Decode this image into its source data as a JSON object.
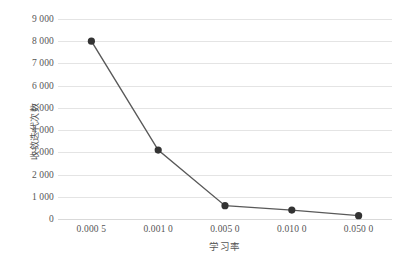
{
  "chart_data": {
    "type": "line",
    "title": "",
    "xlabel": "学习率",
    "ylabel": "收敛迭代次数",
    "categories": [
      "0.000 5",
      "0.001 0",
      "0.005 0",
      "0.010 0",
      "0.050 0"
    ],
    "x_values": [
      0.0005,
      0.001,
      0.005,
      0.01,
      0.05
    ],
    "values": [
      8000,
      3100,
      600,
      400,
      150
    ],
    "series": [
      {
        "name": "收敛迭代次数",
        "values": [
          8000,
          3100,
          600,
          400,
          150
        ]
      }
    ],
    "ylim": [
      0,
      9000
    ],
    "y_ticks": [
      0,
      1000,
      2000,
      3000,
      4000,
      5000,
      6000,
      7000,
      8000,
      9000
    ],
    "y_tick_labels": [
      "0",
      "1 000",
      "2 000",
      "3 000",
      "4 000",
      "5 000",
      "6 000",
      "7 000",
      "8 000",
      "9 000"
    ],
    "grid": true,
    "legend": false,
    "legend_position": "none",
    "marker": "circle",
    "colors": {
      "line": "#595959",
      "marker": "#333333",
      "grid": "#e4e4e4",
      "axis": "#d9d9d9",
      "text": "#555555",
      "background": "#ffffff"
    }
  }
}
